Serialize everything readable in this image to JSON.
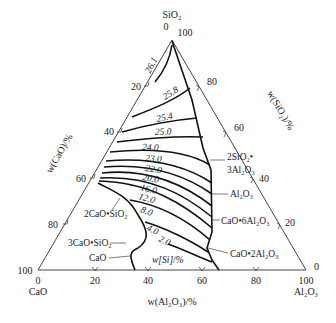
{
  "diagram": {
    "type": "ternary-isoline",
    "vertices": {
      "top": "SiO₂",
      "left": "CaO",
      "right": "Al₂O₃"
    },
    "axes": {
      "left_title": "w(CaO)/%",
      "right_title": "w(SiO₂)/%",
      "bottom_title": "w(Al₂O₃)/%",
      "left_ticks": [
        "0",
        "20",
        "40",
        "60",
        "80",
        "100"
      ],
      "right_ticks": [
        "100",
        "80",
        "60",
        "40",
        "20",
        "0"
      ],
      "bottom_ticks": [
        "0",
        "20",
        "40",
        "60",
        "80",
        "100"
      ]
    },
    "corner_values": {
      "apex_top": "0",
      "apex_right": "100",
      "left_100": "100",
      "left_0": "0",
      "right_0": "0",
      "right_100": "100"
    },
    "isolines_label": "w[Si]/%",
    "isolines": [
      "26.1",
      "25.8",
      "25.4",
      "25.0",
      "24.0",
      "23.0",
      "22.0",
      "20.0",
      "16.0",
      "12.0",
      "8.0",
      "4.0",
      "2.0"
    ],
    "phase_fields": [
      "2SiO₂•",
      "3Al₂O₃",
      "Al₂O₃",
      "CaO•6Al₂O₃",
      "CaO•2Al₂O₃",
      "2CaO•SiO₂",
      "3CaO•SiO₂",
      "CaO"
    ]
  }
}
